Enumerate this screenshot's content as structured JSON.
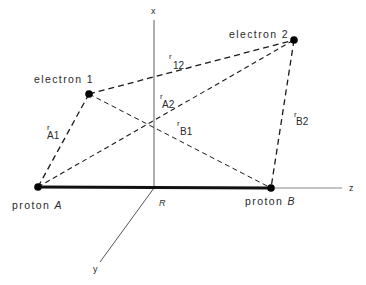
{
  "diagram": {
    "axes": {
      "x": {
        "label": "x"
      },
      "y": {
        "label": "y"
      },
      "z": {
        "label": "z"
      },
      "origin_label": "R"
    },
    "nodes": {
      "electron1": {
        "label": "electron 1"
      },
      "electron2": {
        "label": "electron 2"
      },
      "protonA": {
        "label_prefix": "proton",
        "label_letter": "A"
      },
      "protonB": {
        "label_prefix": "proton",
        "label_letter": "B"
      }
    },
    "distances": {
      "r12": {
        "sym": "r",
        "sub": "12"
      },
      "rA1": {
        "sym": "r",
        "sub": "A1"
      },
      "rA2": {
        "sym": "r",
        "sub": "A2"
      },
      "rB1": {
        "sym": "r",
        "sub": "B1"
      },
      "rB2": {
        "sym": "r",
        "sub": "B2"
      }
    },
    "colors": {
      "ink": "#1a1a1a",
      "axis": "#666666",
      "background": "#ffffff"
    }
  }
}
